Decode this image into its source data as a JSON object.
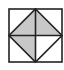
{
  "diagram": {
    "type": "geometric-figure",
    "colors": {
      "background": "#ffffff",
      "stroke": "#222222",
      "shade": "#c8c8c8"
    },
    "square": {
      "x": 9,
      "y": 9,
      "size": 53
    },
    "shaded_quadrants": [
      "top-left",
      "top-right",
      "bottom-left"
    ],
    "unshaded_quadrants": [
      "bottom-right"
    ]
  }
}
